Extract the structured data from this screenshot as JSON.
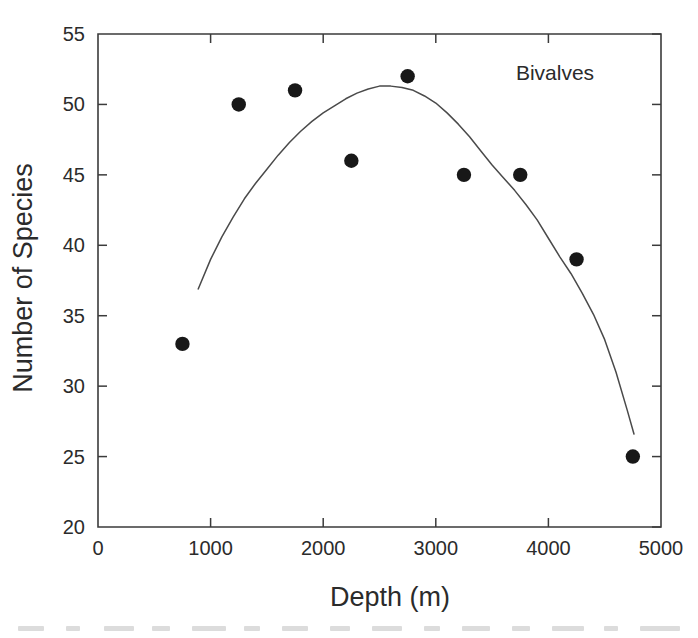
{
  "chart_data": {
    "type": "scatter",
    "title": "",
    "annotation": "Bivalves",
    "xlabel": "Depth (m)",
    "ylabel": "Number of Species",
    "xlim": [
      0,
      5000
    ],
    "ylim": [
      20,
      55
    ],
    "xticks": [
      0,
      1000,
      2000,
      3000,
      4000,
      5000
    ],
    "yticks": [
      20,
      25,
      30,
      35,
      40,
      45,
      50,
      55
    ],
    "xtick_labels": [
      "0",
      "1000",
      "2000",
      "3000",
      "4000",
      "5000"
    ],
    "ytick_labels": [
      "20",
      "25",
      "30",
      "35",
      "40",
      "45",
      "50",
      "55"
    ],
    "grid": false,
    "legend": "none",
    "series": [
      {
        "name": "Bivalves",
        "type": "scatter",
        "marker": "filled-circle",
        "color": "#181818",
        "points": [
          {
            "x": 750,
            "y": 33
          },
          {
            "x": 1250,
            "y": 50
          },
          {
            "x": 1750,
            "y": 51
          },
          {
            "x": 2250,
            "y": 46
          },
          {
            "x": 2750,
            "y": 52
          },
          {
            "x": 3250,
            "y": 45
          },
          {
            "x": 3750,
            "y": 45
          },
          {
            "x": 4250,
            "y": 39
          },
          {
            "x": 4750,
            "y": 25
          }
        ]
      },
      {
        "name": "fitted curve",
        "type": "line",
        "color": "#4a4a4a",
        "points": [
          {
            "x": 890,
            "y": 36.9
          },
          {
            "x": 1000,
            "y": 39.0
          },
          {
            "x": 1100,
            "y": 40.6
          },
          {
            "x": 1200,
            "y": 42.0
          },
          {
            "x": 1300,
            "y": 43.3
          },
          {
            "x": 1400,
            "y": 44.4
          },
          {
            "x": 1500,
            "y": 45.4
          },
          {
            "x": 1600,
            "y": 46.4
          },
          {
            "x": 1700,
            "y": 47.3
          },
          {
            "x": 1800,
            "y": 48.1
          },
          {
            "x": 1900,
            "y": 48.8
          },
          {
            "x": 2000,
            "y": 49.4
          },
          {
            "x": 2100,
            "y": 49.9
          },
          {
            "x": 2200,
            "y": 50.4
          },
          {
            "x": 2300,
            "y": 50.8
          },
          {
            "x": 2400,
            "y": 51.1
          },
          {
            "x": 2500,
            "y": 51.3
          },
          {
            "x": 2600,
            "y": 51.3
          },
          {
            "x": 2700,
            "y": 51.2
          },
          {
            "x": 2800,
            "y": 51.0
          },
          {
            "x": 2900,
            "y": 50.6
          },
          {
            "x": 3000,
            "y": 50.1
          },
          {
            "x": 3100,
            "y": 49.4
          },
          {
            "x": 3200,
            "y": 48.6
          },
          {
            "x": 3300,
            "y": 47.7
          },
          {
            "x": 3400,
            "y": 46.7
          },
          {
            "x": 3500,
            "y": 45.7
          },
          {
            "x": 3600,
            "y": 44.8
          },
          {
            "x": 3700,
            "y": 43.9
          },
          {
            "x": 3800,
            "y": 42.9
          },
          {
            "x": 3900,
            "y": 41.8
          },
          {
            "x": 4000,
            "y": 40.5
          },
          {
            "x": 4100,
            "y": 39.2
          },
          {
            "x": 4200,
            "y": 38.0
          },
          {
            "x": 4300,
            "y": 36.6
          },
          {
            "x": 4400,
            "y": 35.1
          },
          {
            "x": 4500,
            "y": 33.3
          },
          {
            "x": 4600,
            "y": 31.0
          },
          {
            "x": 4700,
            "y": 28.3
          },
          {
            "x": 4760,
            "y": 26.6
          }
        ]
      }
    ]
  },
  "colors": {
    "marker": "#181818",
    "curve": "#4a4a4a",
    "axis": "#3b3b3b",
    "text": "#2b2b2b",
    "background": "#ffffff"
  }
}
